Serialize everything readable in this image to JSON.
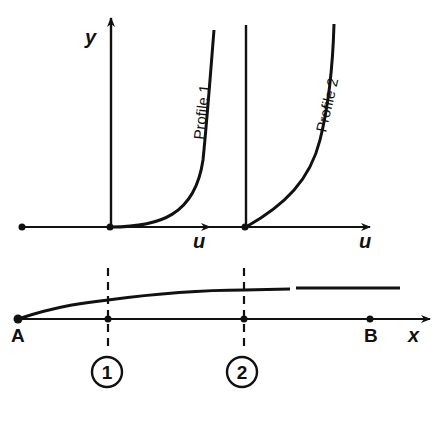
{
  "diagram": {
    "type": "boundary-layer velocity profiles",
    "colors": {
      "ink": "#111111",
      "background": "#ffffff"
    },
    "axes": {
      "y_label": "y",
      "u_label_1": "u",
      "u_label_2": "u",
      "x_label": "x"
    },
    "profiles": [
      {
        "label": "Profile 1",
        "station": "1"
      },
      {
        "label": "Profile 2",
        "station": "2"
      }
    ],
    "plate": {
      "start_label": "A",
      "end_label": "B"
    },
    "stations": [
      {
        "marker": "1"
      },
      {
        "marker": "2"
      }
    ]
  }
}
